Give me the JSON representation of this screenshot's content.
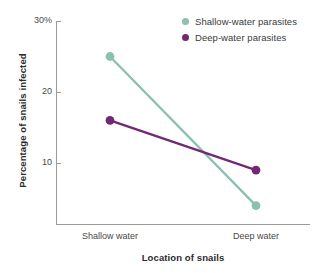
{
  "chart_data": {
    "type": "line",
    "title": "",
    "xlabel": "Location of snails",
    "ylabel": "Percentage of snails infected",
    "categories": [
      "Shallow water",
      "Deep water"
    ],
    "series": [
      {
        "name": "Shallow-water parasites",
        "color": "#8cc0b0",
        "values": [
          25,
          4
        ]
      },
      {
        "name": "Deep-water parasites",
        "color": "#722872",
        "values": [
          16,
          9
        ]
      }
    ],
    "ylim": [
      0,
      30
    ],
    "yticks": [
      30,
      20,
      10
    ],
    "ytick_labels": [
      "30%",
      "20",
      "10"
    ],
    "grid": false,
    "legend_position": "top-right",
    "marker": "circle"
  },
  "axes": {
    "y_title": "Percentage of snails infected",
    "x_title": "Location of snails",
    "y_tick_0": "30%",
    "y_tick_1": "20",
    "y_tick_2": "10",
    "x_tick_0": "Shallow water",
    "x_tick_1": "Deep water"
  },
  "legend": {
    "items": [
      {
        "label": "Shallow-water parasites",
        "color": "#8cc0b0"
      },
      {
        "label": "Deep-water parasites",
        "color": "#722872"
      }
    ]
  },
  "colors": {
    "shallow": "#8cc0b0",
    "deep": "#722872",
    "axis": "#9a9a9a",
    "text": "#3a3a3a",
    "background": "#ffffff"
  }
}
